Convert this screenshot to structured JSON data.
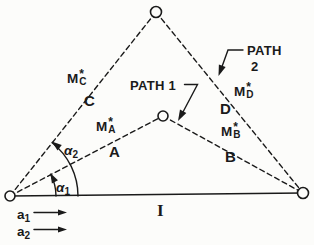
{
  "figure": {
    "colors": {
      "ink": "#1a1a1a",
      "background": "#fcfcfa"
    },
    "icons": {
      "arrowhead": "filled-triangle",
      "vertex_node": "open-circle"
    },
    "path_labels": {
      "path1": "PATH 1",
      "path2_top": "PATH",
      "path2_bottom": "2"
    },
    "markers": {
      "mc": {
        "base": "M",
        "sup": "*",
        "sub": "C"
      },
      "ma": {
        "base": "M",
        "sup": "*",
        "sub": "A"
      },
      "md": {
        "base": "M",
        "sup": "*",
        "sub": "D"
      },
      "mb": {
        "base": "M",
        "sup": "*",
        "sub": "B"
      }
    },
    "region_labels": {
      "c": "C",
      "a": "A",
      "d": "D",
      "b": "B"
    },
    "angle_labels": {
      "alpha1": {
        "base": "α",
        "sub": "1"
      },
      "alpha2": {
        "base": "α",
        "sub": "2"
      }
    },
    "vector_labels": {
      "a1": {
        "base": "a",
        "sub": "1"
      },
      "a2": {
        "base": "a",
        "sub": "2"
      }
    },
    "baseline_label": "I"
  }
}
